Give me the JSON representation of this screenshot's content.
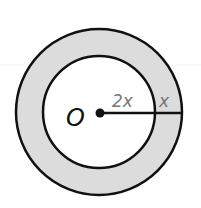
{
  "diagram": {
    "center_label": "O",
    "inner_radius_label": "2x",
    "ring_width_label": "x",
    "colors": {
      "ring_fill": "#dcdcdc",
      "inner_fill": "#ffffff",
      "stroke": "#111111",
      "radius_label": "#777777",
      "center_label": "#111111"
    }
  }
}
